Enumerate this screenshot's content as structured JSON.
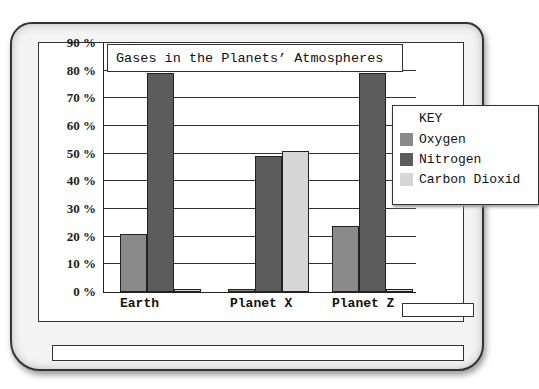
{
  "chart_data": {
    "type": "bar",
    "title": "Gases in the Planets’ Atmospheres",
    "xlabel": "",
    "ylabel": "",
    "ylim": [
      0,
      90
    ],
    "yticks": [
      "0 %",
      "10 %",
      "20 %",
      "30 %",
      "40 %",
      "50 %",
      "60 %",
      "70 %",
      "80 %",
      "90 %"
    ],
    "grid": true,
    "legend_position": "right",
    "legend_title": "KEY",
    "categories": [
      "Earth",
      "Planet X",
      "Planet Z"
    ],
    "series": [
      {
        "name": "Oxygen",
        "color": "#8a8a8a",
        "values": [
          21,
          1,
          24
        ]
      },
      {
        "name": "Nitrogen",
        "color": "#5c5c5c",
        "values": [
          79,
          49,
          79
        ]
      },
      {
        "name": "Carbon Dioxide",
        "color": "#d6d6d6",
        "values": [
          1,
          51,
          1
        ]
      }
    ]
  },
  "labels": {
    "title": "Gases in the Planets’ Atmospheres",
    "legend_key": "KEY",
    "legend_items": [
      "Oxygen",
      "Nitrogen",
      "Carbon Dioxid"
    ],
    "x": [
      "Earth",
      "Planet X",
      "Planet Z"
    ],
    "y": [
      "90 %",
      "80 %",
      "70 %",
      "60 %",
      "50 %",
      "40 %",
      "30 %",
      "20 %",
      "10 %",
      "0 %"
    ]
  }
}
